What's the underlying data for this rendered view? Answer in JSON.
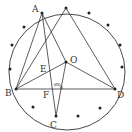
{
  "diagram": {
    "type": "geometry-circle",
    "circle": {
      "cx": 67,
      "cy": 72,
      "r": 58
    },
    "points": {
      "A": {
        "x": 42,
        "y": 13,
        "label": "A",
        "lx": 32,
        "ly": 12
      },
      "T": {
        "x": 66,
        "y": 8,
        "label": "",
        "lx": 0,
        "ly": 0
      },
      "O": {
        "x": 66,
        "y": 62,
        "label": "O",
        "lx": 70,
        "ly": 63
      },
      "B": {
        "x": 16,
        "y": 89,
        "label": "B",
        "lx": 5,
        "ly": 96
      },
      "D": {
        "x": 115,
        "y": 89,
        "label": "D",
        "lx": 117,
        "ly": 98
      },
      "C": {
        "x": 56,
        "y": 116,
        "label": "C",
        "lx": 50,
        "ly": 128
      },
      "E": {
        "x": 47,
        "y": 72,
        "label": "E",
        "lx": 40,
        "ly": 72
      },
      "F": {
        "x": 52,
        "y": 89,
        "label": "F",
        "lx": 43,
        "ly": 98
      }
    },
    "segments": [
      [
        "A",
        "B"
      ],
      [
        "A",
        "C"
      ],
      [
        "A",
        "O"
      ],
      [
        "T",
        "B"
      ],
      [
        "T",
        "D"
      ],
      [
        "O",
        "B"
      ],
      [
        "O",
        "D"
      ],
      [
        "O",
        "C"
      ],
      [
        "B",
        "D"
      ]
    ],
    "circle_dots": [
      [
        24,
        27
      ],
      [
        12,
        45
      ],
      [
        10,
        69
      ],
      [
        33,
        107
      ],
      [
        78,
        116
      ],
      [
        100,
        108
      ],
      [
        89,
        13
      ],
      [
        108,
        25
      ],
      [
        120,
        45
      ],
      [
        122,
        67
      ]
    ],
    "angle_mark": {
      "x": 57,
      "y": 89,
      "label": "double-arc"
    },
    "colors": {
      "stroke": "#333333",
      "dot": "#222222",
      "label": "#333333"
    }
  }
}
